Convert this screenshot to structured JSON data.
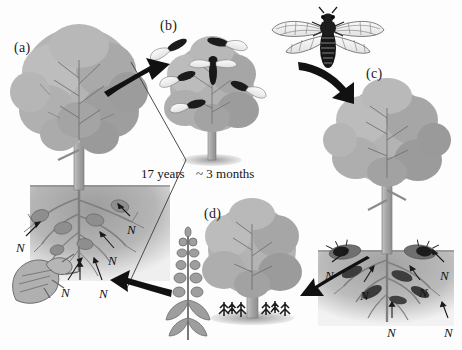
{
  "figure": {
    "background_color": "#fdfdfd",
    "width": 462,
    "height": 350
  },
  "panels": [
    {
      "id": "a",
      "label": "(a)",
      "x": 14,
      "y": 40,
      "description": "Mature tree with belowground root system containing cicada nymphs feeding on roots; nymph shown at left",
      "stage": "nymphs feeding on tree roots underground"
    },
    {
      "id": "b",
      "label": "(b)",
      "x": 160,
      "y": 18,
      "description": "Tree covered with emerged adult periodical cicadas",
      "stage": "adult emergence onto tree"
    },
    {
      "id": "c",
      "label": "(c)",
      "x": 366,
      "y": 66,
      "description": "Tree with dead adult cicada carcasses decomposing on soil surface and in root zone",
      "stage": "adult death and decomposition"
    },
    {
      "id": "d",
      "label": "(d)",
      "x": 204,
      "y": 206,
      "description": "Tree with seedlings at the base and flowering understory plant benefiting from nitrogen pulse",
      "stage": "nutrient uptake, seedling and understory growth"
    }
  ],
  "time_labels": [
    {
      "text": "17 years",
      "x": 141,
      "y": 166
    },
    {
      "text": "~ 3 months",
      "x": 196,
      "y": 166
    }
  ],
  "nitrogen_labels": {
    "symbol": "N",
    "panel_a": [
      {
        "x": 16,
        "y": 240
      },
      {
        "x": 61,
        "y": 285
      },
      {
        "x": 99,
        "y": 286
      },
      {
        "x": 108,
        "y": 253
      },
      {
        "x": 127,
        "y": 222
      }
    ],
    "panel_c": [
      {
        "x": 325,
        "y": 268
      },
      {
        "x": 360,
        "y": 288
      },
      {
        "x": 387,
        "y": 325
      },
      {
        "x": 419,
        "y": 285
      },
      {
        "x": 440,
        "y": 268
      },
      {
        "x": 444,
        "y": 325
      }
    ]
  },
  "arrows": [
    {
      "id": "a-to-b",
      "from": "a",
      "to": "b",
      "direction": "up-right",
      "color": "#111111"
    },
    {
      "id": "adult-to-c",
      "from": "adult-cicada",
      "to": "c",
      "direction": "down-right",
      "color": "#111111"
    },
    {
      "id": "c-to-d",
      "from": "c",
      "to": "d",
      "direction": "down-left",
      "color": "#111111"
    },
    {
      "id": "d-to-a",
      "from": "d",
      "to": "a",
      "direction": "up-left",
      "color": "#111111"
    }
  ],
  "adult_cicada": {
    "name": "adult-cicada-illustration",
    "x": 290,
    "y": 8,
    "description": "Dorsal view of an adult periodical cicada with two pairs of transparent veined wings and dark segmented abdomen"
  },
  "colors": {
    "foliage_light": "#b9b9b9",
    "foliage_mid": "#a0a0a0",
    "foliage_dark": "#8a8a8a",
    "trunk": "#a8a8a8",
    "soil": "#b2b2b2",
    "root": "#8f8f8f",
    "cicada_body": "#1b1b1b",
    "arrow": "#111111",
    "text": "#141414",
    "outline": "#6d6d6d"
  }
}
